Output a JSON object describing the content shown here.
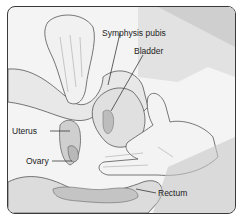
{
  "figure": {
    "labels": {
      "symphysis_pubis": "Symphysis pubis",
      "bladder": "Bladder",
      "uterus": "Uterus",
      "ovary": "Ovary",
      "rectum": "Rectum"
    },
    "colors": {
      "border": "#3a3a3a",
      "background": "#f4f4f4",
      "tissue": "#d8d8d8",
      "shadow": "#9a9a9a",
      "glove": "#f0f0f0"
    }
  }
}
